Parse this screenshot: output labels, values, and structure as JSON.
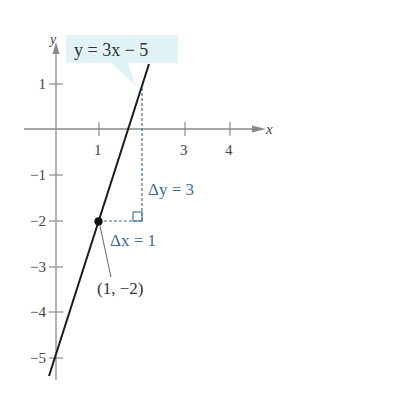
{
  "figure": {
    "equation_label": "y = 3x − 5",
    "axis_labels": {
      "x": "x",
      "y": "y"
    },
    "x_ticks": [
      {
        "value": 1,
        "label": "1"
      },
      {
        "value": 3,
        "label": "3"
      },
      {
        "value": 4,
        "label": "4"
      }
    ],
    "y_ticks": [
      {
        "value": 1,
        "label": "1"
      },
      {
        "value": -1,
        "label": "−1"
      },
      {
        "value": -2,
        "label": "−2"
      },
      {
        "value": -3,
        "label": "−3"
      },
      {
        "value": -4,
        "label": "−4"
      },
      {
        "value": -5,
        "label": "−5"
      }
    ],
    "point": {
      "x": 1,
      "y": -2,
      "label": "(1, −2)"
    },
    "delta_x_label": "Δx = 1",
    "delta_y_label": "Δy = 3",
    "line": {
      "slope": 3,
      "intercept": -5
    },
    "colors": {
      "axis": "#8a8a8a",
      "line": "#1a1a1a",
      "annotation": "#3d6c97",
      "callout_fill": "#e2f3f8",
      "text": "#333333"
    }
  }
}
